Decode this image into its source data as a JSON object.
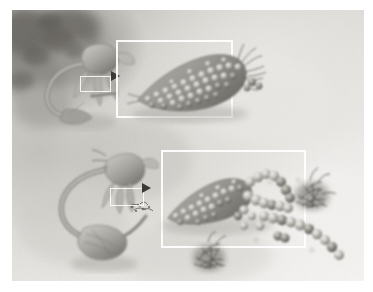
{
  "figure": {
    "title": "Grayscale scientific illustration of microbial disassembly at a cell surface",
    "style": "airbrush pencil rendering, monochrome warm-gray",
    "background_color": "#ddddd8",
    "page_margin_color": "#ffffff",
    "canvas": {
      "x": 12,
      "y": 10,
      "width": 352,
      "height": 271
    }
  },
  "panels": [
    {
      "id": "upper",
      "name": "intact-stage",
      "description": "A cell with tapering processes contacts an elongated knobbed microbial body; a small source box on the cell surface is magnified into the large detail frame.",
      "source_box": {
        "x": 80,
        "y": 76,
        "width": 31,
        "height": 16
      },
      "detail_frame": {
        "x": 116,
        "y": 40,
        "width": 117,
        "height": 78
      },
      "arrow": {
        "x": 111,
        "y": 71,
        "direction": "right"
      }
    },
    {
      "id": "lower",
      "name": "disassembly-stage",
      "description": "A second cell with a long curving tail; its surface box is magnified to show the knobbed body shedding chains of spheres alongside tangled fibrous clusters.",
      "source_box": {
        "x": 110,
        "y": 188,
        "width": 34,
        "height": 18
      },
      "detail_frame": {
        "x": 161,
        "y": 150,
        "width": 145,
        "height": 98
      },
      "arrow": {
        "x": 142,
        "y": 183,
        "direction": "right"
      }
    }
  ],
  "elements": {
    "cells": [
      {
        "name": "upper-cell",
        "label": "host cell with membrane processes"
      },
      {
        "name": "lower-cell",
        "label": "host cell with trailing uropod"
      }
    ],
    "microbes": [
      {
        "name": "upper-microbe",
        "label": "intact elongated knobbed body"
      },
      {
        "name": "lower-microbe",
        "label": "partially disassembled knobbed body"
      }
    ],
    "particles": {
      "name": "sphere-chains",
      "label": "chains of released spherical subunits",
      "count": 34
    },
    "fibrous_clusters": {
      "name": "fibrous-tangles",
      "label": "dark tangled filament clusters",
      "count": 2
    }
  },
  "colors": {
    "ink_dark": "#46443f",
    "ink_mid": "#8a8881",
    "ink_light": "#c9c7c1",
    "frame_white": "#ffffff",
    "arrow_black": "#3b3a36",
    "canvas_base": "#d9d8d3"
  }
}
